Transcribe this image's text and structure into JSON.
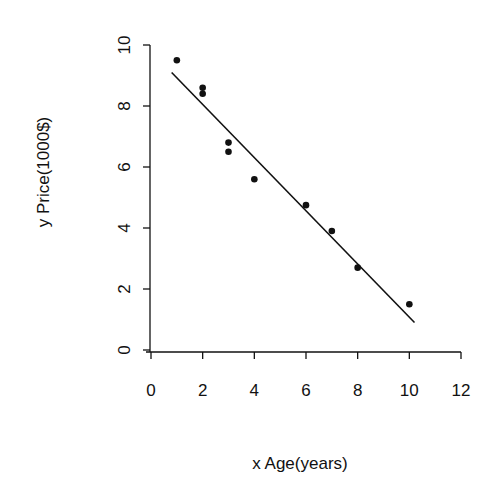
{
  "chart_data": {
    "type": "scatter",
    "title": "",
    "xlabel": "x Age(years)",
    "ylabel": "y Price(1000$)",
    "xlim": [
      0,
      12
    ],
    "ylim": [
      0,
      10
    ],
    "xticks": [
      0,
      2,
      4,
      6,
      8,
      10,
      12
    ],
    "yticks": [
      0,
      2,
      4,
      6,
      8,
      10
    ],
    "grid": false,
    "legend": null,
    "series": [
      {
        "name": "observations",
        "kind": "scatter",
        "x": [
          1,
          2,
          2,
          3,
          3,
          4,
          6,
          7,
          8,
          10
        ],
        "y": [
          9.5,
          8.6,
          8.4,
          6.8,
          6.5,
          5.6,
          4.75,
          3.9,
          2.7,
          1.5
        ]
      },
      {
        "name": "regression-line",
        "kind": "line",
        "x": [
          0.8,
          10.2
        ],
        "y": [
          9.1,
          0.9
        ]
      }
    ],
    "colors": {
      "points": "#111111",
      "line": "#111111",
      "axes": "#111111"
    }
  }
}
